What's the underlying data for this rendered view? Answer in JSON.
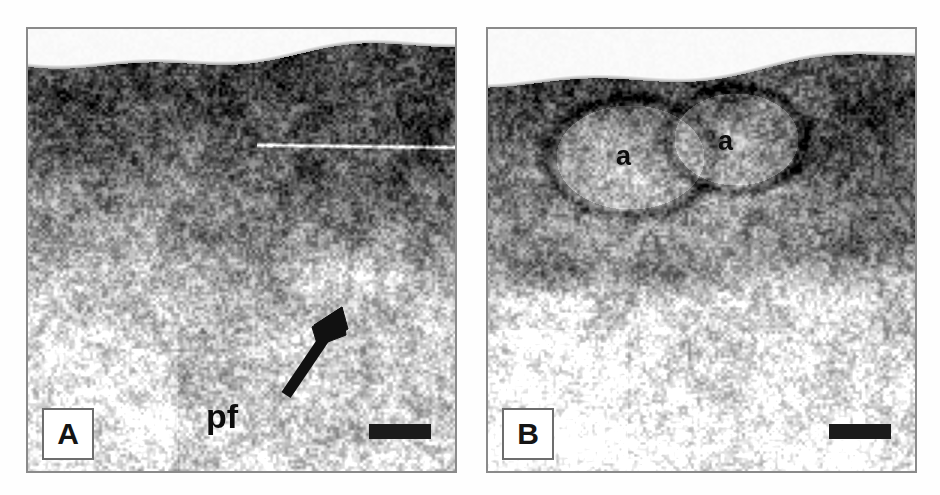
{
  "figure": {
    "type": "ultrasonographic-figure",
    "panel_count": 2,
    "background_color": "#ffffff",
    "frame_color": "#8a8a8a",
    "annotation_color": "#0d0d0d",
    "scalebar_color": "#1b1b1b"
  },
  "panels": [
    {
      "id": "A",
      "tag": "A",
      "modality": "B-mode ultrasound",
      "description": "Longitudinal sonogram showing a hyperechoic superficial band over a heterogeneous hypoechoic region; speckle texture throughout.",
      "annotations": [
        {
          "name": "pf-arrow",
          "kind": "arrow",
          "label": "pf",
          "points_to": "hypoechoic focal area"
        },
        {
          "name": "pf-label",
          "kind": "text",
          "text": "pf"
        }
      ],
      "scale_bar": {
        "visible": true,
        "color": "#1b1b1b"
      }
    },
    {
      "id": "B",
      "tag": "B",
      "modality": "B-mode ultrasound",
      "description": "Longitudinal sonogram showing two rounded echogenic structures outlined by dark rims, each marked 'a'.",
      "annotations": [
        {
          "name": "a-label-1",
          "kind": "text",
          "text": "a"
        },
        {
          "name": "a-label-2",
          "kind": "text",
          "text": "a"
        }
      ],
      "scale_bar": {
        "visible": true,
        "color": "#1b1b1b"
      }
    }
  ],
  "labels": {
    "panel_a_tag": "A",
    "panel_b_tag": "B",
    "pf": "pf",
    "a_first": "a",
    "a_second": "a"
  }
}
